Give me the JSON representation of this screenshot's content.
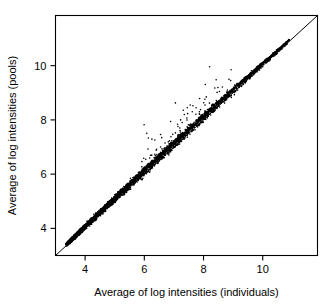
{
  "figure": {
    "background_color": "#ffffff",
    "foreground_color": "#000000"
  },
  "axes": {
    "x_title": "Average of log intensities (individuals)",
    "y_title": "Average of log intensities (pools)",
    "x_ticks": [
      "4",
      "6",
      "8",
      "10"
    ],
    "y_ticks": [
      "4",
      "6",
      "8",
      "10"
    ]
  },
  "chart_data": {
    "type": "scatter",
    "title": "",
    "subtitle": "",
    "xlabel": "Average of log intensities (individuals)",
    "ylabel": "Average of log intensities (pools)",
    "xlim": [
      3.0,
      11.85
    ],
    "ylim": [
      3.0,
      11.85
    ],
    "xticks": [
      4,
      6,
      8,
      10
    ],
    "yticks": [
      4,
      6,
      8,
      10
    ],
    "grid": false,
    "legend": null,
    "legend_position": "none",
    "annotations": [],
    "reference_line": {
      "name": "identity-line",
      "type": "line",
      "equation": "y = x",
      "x": [
        3.0,
        11.85
      ],
      "y": [
        3.0,
        11.85
      ],
      "color": "#000000"
    },
    "marker": {
      "shape": "circle",
      "size_px": 1.1,
      "color": "#000000"
    },
    "series": [
      {
        "name": "genes",
        "color": "#000000",
        "n_points_approx": 4200,
        "points_sample": [
          [
            3.45,
            3.47
          ],
          [
            3.52,
            3.55
          ],
          [
            3.6,
            3.62
          ],
          [
            3.68,
            3.71
          ],
          [
            3.75,
            3.78
          ],
          [
            3.82,
            3.86
          ],
          [
            3.9,
            3.94
          ],
          [
            3.98,
            4.03
          ],
          [
            4.05,
            4.1
          ],
          [
            4.12,
            4.18
          ],
          [
            4.2,
            4.26
          ],
          [
            4.28,
            4.34
          ],
          [
            4.35,
            4.42
          ],
          [
            4.43,
            4.5
          ],
          [
            4.5,
            4.58
          ],
          [
            4.58,
            4.66
          ],
          [
            4.65,
            4.73
          ],
          [
            4.72,
            4.81
          ],
          [
            4.8,
            4.89
          ],
          [
            4.88,
            4.97
          ],
          [
            4.95,
            5.04
          ],
          [
            5.02,
            5.12
          ],
          [
            5.1,
            5.2
          ],
          [
            5.18,
            5.28
          ],
          [
            5.25,
            5.35
          ],
          [
            5.33,
            5.43
          ],
          [
            5.4,
            5.51
          ],
          [
            5.48,
            5.58
          ],
          [
            5.55,
            5.66
          ],
          [
            5.63,
            5.74
          ],
          [
            5.7,
            5.81
          ],
          [
            5.78,
            5.89
          ],
          [
            5.85,
            5.96
          ],
          [
            5.93,
            6.04
          ],
          [
            6.0,
            6.11
          ],
          [
            6.08,
            6.19
          ],
          [
            6.15,
            6.26
          ],
          [
            6.23,
            6.34
          ],
          [
            6.3,
            6.41
          ],
          [
            6.38,
            6.49
          ],
          [
            6.45,
            6.56
          ],
          [
            6.53,
            6.64
          ],
          [
            6.6,
            6.71
          ],
          [
            6.68,
            6.79
          ],
          [
            6.75,
            6.86
          ],
          [
            6.83,
            6.94
          ],
          [
            6.9,
            7.01
          ],
          [
            6.98,
            7.08
          ],
          [
            7.05,
            7.15
          ],
          [
            7.13,
            7.23
          ],
          [
            7.2,
            7.3
          ],
          [
            7.35,
            7.44
          ],
          [
            7.5,
            7.59
          ],
          [
            7.65,
            7.73
          ],
          [
            7.8,
            7.88
          ],
          [
            7.95,
            8.02
          ],
          [
            8.1,
            8.17
          ],
          [
            8.25,
            8.31
          ],
          [
            8.4,
            8.46
          ],
          [
            8.55,
            8.6
          ],
          [
            8.7,
            8.75
          ],
          [
            8.85,
            8.89
          ],
          [
            9.0,
            9.04
          ],
          [
            9.2,
            9.23
          ],
          [
            9.4,
            9.43
          ],
          [
            9.6,
            9.62
          ],
          [
            9.9,
            9.92
          ],
          [
            10.2,
            10.21
          ],
          [
            6.05,
            6.55
          ],
          [
            6.25,
            6.7
          ],
          [
            6.4,
            6.88
          ],
          [
            6.55,
            7.0
          ],
          [
            6.7,
            7.15
          ],
          [
            6.9,
            7.38
          ],
          [
            7.05,
            7.52
          ],
          [
            7.2,
            7.7
          ],
          [
            7.35,
            8.2
          ],
          [
            7.45,
            8.45
          ],
          [
            7.55,
            8.55
          ],
          [
            7.62,
            8.3
          ],
          [
            7.75,
            8.45
          ],
          [
            7.9,
            8.38
          ],
          [
            8.05,
            8.55
          ],
          [
            8.2,
            8.62
          ],
          [
            8.45,
            8.68
          ],
          [
            9.25,
            9.4
          ]
        ]
      }
    ]
  }
}
